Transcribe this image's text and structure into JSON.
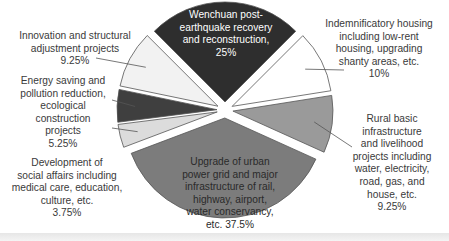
{
  "chart_data": {
    "type": "pie",
    "title": "",
    "exploded": true,
    "start_angle_deg": -45,
    "direction": "clockwise",
    "slices": [
      {
        "label": "Wenchuan post-earthquake recovery and reconstruction",
        "value": 25,
        "display": "Wenchuan post-\nearthquake recovery\nand reconstruction,\n25%",
        "color": "#2e2e2e",
        "label_position": "inside"
      },
      {
        "label": "Indemnificatory housing including low-rent housing, upgrading shanty areas, etc.",
        "value": 10,
        "display": "Indemnificatory housing\nincluding low-rent\nhousing, upgrading\nshanty areas, etc.\n10%",
        "color": "#ffffff",
        "label_position": "outside"
      },
      {
        "label": "Rural basic infrastructure and livelihood projects including water, electricity, road, gas, and house, etc.",
        "value": 9.25,
        "display": "Rural basic\ninfrastructure\nand livelihood\nprojects including\nwater, electricity,\nroad, gas, and\nhouse, etc.\n9.25%",
        "color": "#9a9a9a",
        "label_position": "outside"
      },
      {
        "label": "Upgrade of urban power grid and major infrastructure of rail, highway, airport, water conservancy, etc.",
        "value": 37.5,
        "display": "Upgrade of urban\npower grid and major\ninfrastructure of rail,\nhighway, airport,\nwater conservancy,\netc. 37.5%",
        "color": "#7c7c7c",
        "label_position": "inside"
      },
      {
        "label": "Development of social affairs including medical care, education, culture, etc.",
        "value": 3.75,
        "display": "Development of\nsocial affairs including\nmedical care, education,\nculture, etc.\n3.75%",
        "color": "#dcdcdc",
        "label_position": "outside"
      },
      {
        "label": "Energy saving and pollution reduction, ecological construction projects",
        "value": 5.25,
        "display": "Energy saving and\npollution reduction,\necological\nconstruction\nprojects\n5.25%",
        "color": "#3f3f3f",
        "label_position": "outside"
      },
      {
        "label": "Innovation and structural adjustment projects",
        "value": 9.25,
        "display": "Innovation and structural\nadjustment projects\n9.25%",
        "color": "#f2f2f2",
        "label_position": "outside"
      }
    ],
    "legend": "none"
  }
}
